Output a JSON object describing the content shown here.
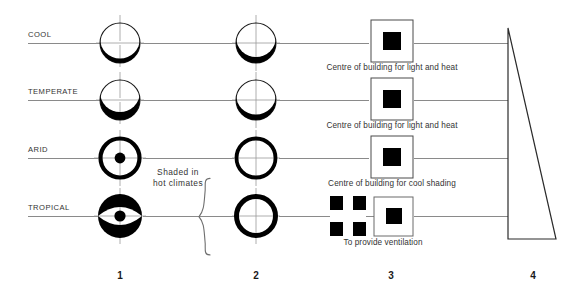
{
  "diagram": {
    "background_color": "#ffffff",
    "line_color": "#808080",
    "ink_color": "#000000",
    "rows": [
      {
        "label": "COOL",
        "y": 43,
        "col1": "crescent-thin-bottom",
        "col2": "crescent-thin-bottom",
        "col3": "solid-square-in-outline",
        "caption": "Centre of building for light and heat"
      },
      {
        "label": "TEMPERATE",
        "y": 100,
        "col1": "crescent-thick-bottom",
        "col2": "crescent-medium-bottom",
        "col3": "solid-square-in-outline",
        "caption": "Centre of building for light and heat"
      },
      {
        "label": "ARID",
        "y": 158,
        "col1": "ring-with-dot",
        "col2": "thick-ring",
        "col3": "solid-square-in-outline",
        "caption": "Centre of building for cool shading"
      },
      {
        "label": "TROPICAL",
        "y": 216,
        "col1": "lens-with-dot",
        "col2": "thick-ring-sides",
        "col3": "ventilation-cross-plus-square",
        "caption": "To provide ventilation"
      }
    ],
    "annotation": {
      "brace_label_line1": "Shaded in",
      "brace_label_line2": "hot climates",
      "brace_x": 205,
      "brace_top": 140,
      "brace_bottom": 238,
      "text_x": 178,
      "text_y": 173
    },
    "columns": [
      {
        "number": "1",
        "x": 120,
        "y": 272
      },
      {
        "number": "2",
        "x": 256,
        "y": 272
      },
      {
        "number": "3",
        "x": 391,
        "y": 272
      },
      {
        "number": "4",
        "x": 533,
        "y": 272
      }
    ],
    "shape4": {
      "name": "right-triangle",
      "apex_x": 508,
      "apex_y": 28,
      "base_left_x": 508,
      "base_left_y": 239,
      "base_right_x": 556,
      "base_right_y": 239
    }
  }
}
